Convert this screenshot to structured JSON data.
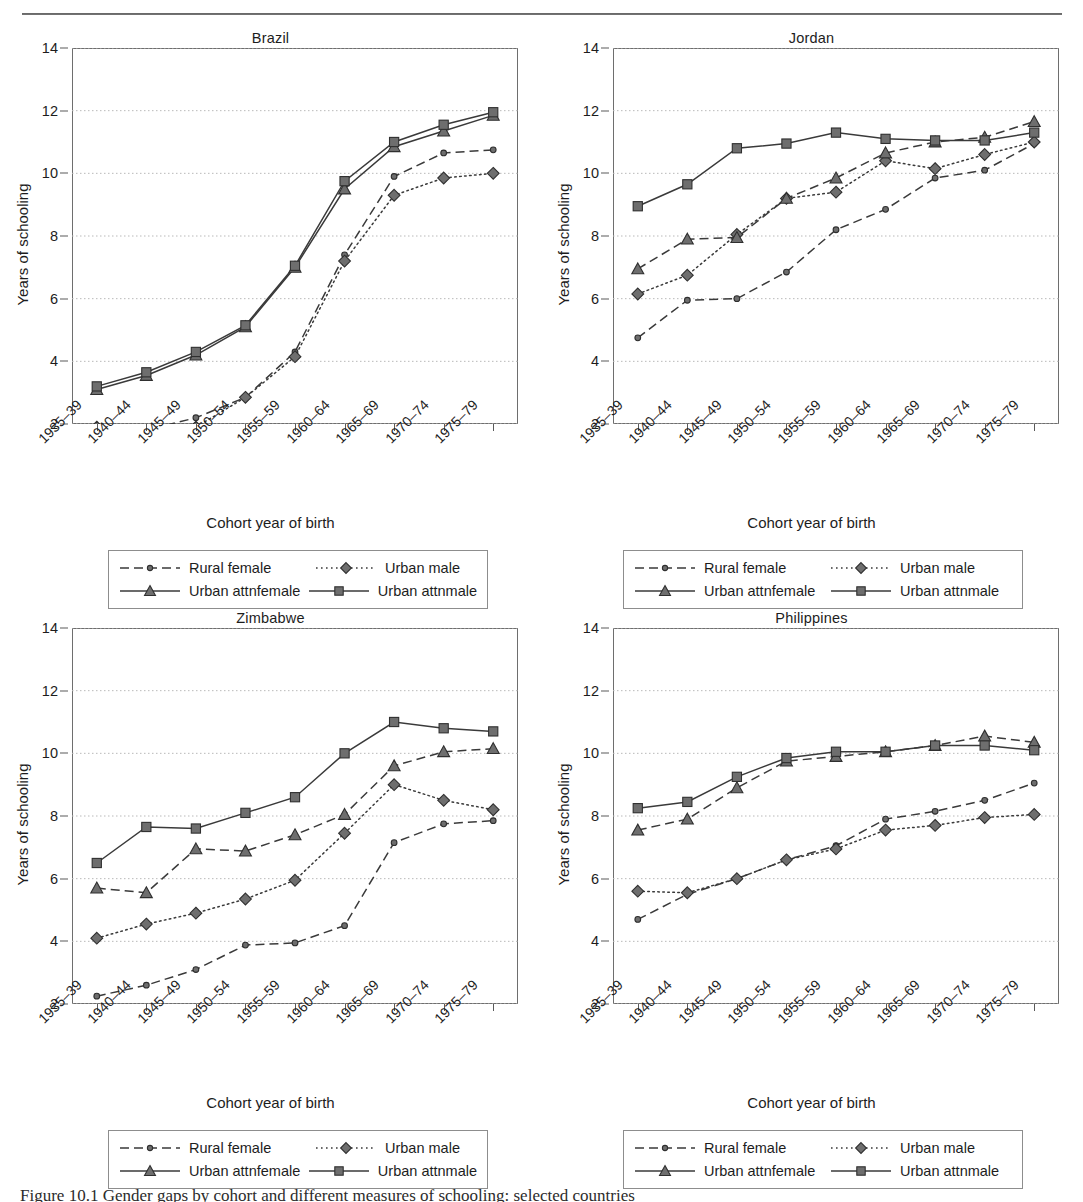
{
  "figure": {
    "caption": "Figure 10.1  Gender gaps by cohort and different measures of schooling: selected countries",
    "y_axis_label": "Years of schooling",
    "x_axis_label": "Cohort year of birth",
    "y_ticks": [
      2,
      4,
      6,
      8,
      10,
      12,
      14
    ],
    "x_categories": [
      "1935–39",
      "1940–44",
      "1945–49",
      "1950–54",
      "1955–59",
      "1960–64",
      "1965–69",
      "1970–74",
      "1975–79"
    ],
    "legend_labels": [
      "Rural female",
      "Urban male",
      "Urban attnfemale",
      "Urban attnmale"
    ],
    "marker_fill": "#6e6e6e",
    "marker_stroke": "#2f2f2f",
    "line_color": "#3a3a3a",
    "grid_color": "#b9b9b9",
    "frame_color": "#6e6e6e"
  },
  "chart_data": [
    {
      "type": "line",
      "title": "Brazil",
      "xlabel": "Cohort year of birth",
      "ylabel": "Years of schooling",
      "ylim": [
        2,
        14
      ],
      "grid": true,
      "legend_position": "below",
      "categories": [
        "1935–39",
        "1940–44",
        "1945–49",
        "1950–54",
        "1955–59",
        "1960–64",
        "1965–69",
        "1970–74",
        "1975–79"
      ],
      "series": [
        {
          "name": "Rural female",
          "style": "dashed",
          "marker": "circle",
          "values": [
            1.75,
            1.8,
            2.2,
            2.85,
            4.3,
            7.4,
            9.9,
            10.65,
            10.75
          ]
        },
        {
          "name": "Urban male",
          "style": "dotted",
          "marker": "diamond",
          "values": [
            1.9,
            1.75,
            1.9,
            2.85,
            4.15,
            7.2,
            9.3,
            9.85,
            10.0
          ]
        },
        {
          "name": "Urban attnfemale",
          "style": "solid",
          "marker": "triangle",
          "values": [
            3.1,
            3.55,
            4.2,
            5.1,
            7.0,
            9.5,
            10.85,
            11.35,
            11.85
          ]
        },
        {
          "name": "Urban attnmale",
          "style": "solid",
          "marker": "square",
          "values": [
            3.2,
            3.65,
            4.3,
            5.15,
            7.05,
            9.75,
            11.0,
            11.55,
            11.95
          ]
        }
      ]
    },
    {
      "type": "line",
      "title": "Jordan",
      "xlabel": "Cohort year of birth",
      "ylabel": "Years of schooling",
      "ylim": [
        2,
        14
      ],
      "grid": true,
      "legend_position": "below",
      "categories": [
        "1935–39",
        "1940–44",
        "1945–49",
        "1950–54",
        "1955–59",
        "1960–64",
        "1965–69",
        "1970–74",
        "1975–79"
      ],
      "series": [
        {
          "name": "Rural female",
          "style": "dashed",
          "marker": "circle",
          "values": [
            4.75,
            5.95,
            6.0,
            6.85,
            8.2,
            8.85,
            9.85,
            10.1,
            10.95
          ]
        },
        {
          "name": "Urban male",
          "style": "dotted",
          "marker": "diamond",
          "values": [
            6.15,
            6.75,
            8.05,
            9.2,
            9.4,
            10.4,
            10.15,
            10.6,
            11.0
          ]
        },
        {
          "name": "Urban attnfemale",
          "style": "dashed",
          "marker": "triangle",
          "values": [
            6.95,
            7.9,
            7.95,
            9.2,
            9.85,
            10.65,
            11.0,
            11.15,
            11.65
          ]
        },
        {
          "name": "Urban attnmale",
          "style": "solid",
          "marker": "square",
          "values": [
            8.95,
            9.65,
            10.8,
            10.95,
            11.3,
            11.1,
            11.05,
            11.05,
            11.3
          ]
        }
      ]
    },
    {
      "type": "line",
      "title": "Zimbabwe",
      "xlabel": "Cohort year of birth",
      "ylabel": "Years of schooling",
      "ylim": [
        2,
        14
      ],
      "grid": true,
      "legend_position": "below",
      "categories": [
        "1935–39",
        "1940–44",
        "1945–49",
        "1950–54",
        "1955–59",
        "1960–64",
        "1965–69",
        "1970–74",
        "1975–79"
      ],
      "series": [
        {
          "name": "Rural female",
          "style": "dashed",
          "marker": "circle",
          "values": [
            2.25,
            2.6,
            3.1,
            3.88,
            3.95,
            4.5,
            7.15,
            7.75,
            7.85
          ]
        },
        {
          "name": "Urban male",
          "style": "dotted",
          "marker": "diamond",
          "values": [
            4.1,
            4.55,
            4.9,
            5.35,
            5.95,
            7.45,
            9.0,
            8.5,
            8.2
          ]
        },
        {
          "name": "Urban attnfemale",
          "style": "dashed",
          "marker": "triangle",
          "values": [
            5.7,
            5.55,
            6.95,
            6.88,
            7.4,
            8.05,
            9.6,
            10.05,
            10.15
          ]
        },
        {
          "name": "Urban attnmale",
          "style": "solid",
          "marker": "square",
          "values": [
            6.5,
            7.65,
            7.6,
            8.1,
            8.6,
            10.0,
            11.0,
            10.8,
            10.7
          ]
        }
      ]
    },
    {
      "type": "line",
      "title": "Philippines",
      "xlabel": "Cohort year of birth",
      "ylabel": "Years of schooling",
      "ylim": [
        2,
        14
      ],
      "grid": true,
      "legend_position": "below",
      "categories": [
        "1935–39",
        "1940–44",
        "1945–49",
        "1950–54",
        "1955–59",
        "1960–64",
        "1965–69",
        "1970–74",
        "1975–79"
      ],
      "series": [
        {
          "name": "Rural female",
          "style": "dashed",
          "marker": "circle",
          "values": [
            4.7,
            5.5,
            6.0,
            6.6,
            7.05,
            7.9,
            8.15,
            8.5,
            9.05
          ]
        },
        {
          "name": "Urban male",
          "style": "dotted",
          "marker": "diamond",
          "values": [
            5.6,
            5.55,
            6.0,
            6.6,
            6.95,
            7.55,
            7.7,
            7.95,
            8.05
          ]
        },
        {
          "name": "Urban attnfemale",
          "style": "dashed",
          "marker": "triangle",
          "values": [
            7.55,
            7.9,
            8.9,
            9.75,
            9.9,
            10.05,
            10.25,
            10.55,
            10.35
          ]
        },
        {
          "name": "Urban attnmale",
          "style": "solid",
          "marker": "square",
          "values": [
            8.25,
            8.45,
            9.25,
            9.85,
            10.05,
            10.05,
            10.25,
            10.25,
            10.1
          ]
        }
      ]
    }
  ]
}
